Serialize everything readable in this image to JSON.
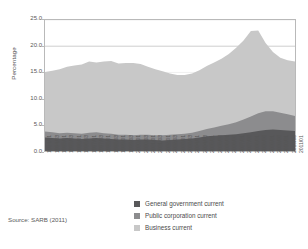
{
  "chart_data": {
    "type": "area",
    "stacked": true,
    "title": "",
    "subtitle": "",
    "xlabel": "",
    "ylabel": "Percentage",
    "ylim": [
      0.0,
      25.0
    ],
    "yticks": [
      "0.0",
      "5.0",
      "10.0",
      "15.0",
      "20.0",
      "25.0"
    ],
    "ytick_values": [
      0.0,
      5.0,
      10.0,
      15.0,
      20.0,
      25.0
    ],
    "grid": "horizontal",
    "legend_position": "bottom-right",
    "categories": [
      "1994/01",
      "1994/03",
      "1995/01",
      "1995/03",
      "1996/01",
      "1996/03",
      "1997/01",
      "1997/03",
      "1998/01",
      "1998/03",
      "1999/01",
      "1999/03",
      "2000/01",
      "2000/03",
      "2001/01",
      "2001/03",
      "2002/01",
      "2002/03",
      "2003/01",
      "2003/03",
      "2004/01",
      "2004/03",
      "2005/01",
      "2005/03",
      "2006/01",
      "2006/03",
      "2007/01",
      "2007/03",
      "2008/01",
      "2008/03",
      "2009/01",
      "2009/03",
      "2010/01",
      "2010/03",
      "2011/01"
    ],
    "tick_labels_shown": [
      "1994/01",
      "1994/03",
      "1995/01",
      "1995/03",
      "1996/01",
      "1996/03",
      "1997/01",
      "1997/03",
      "1998/01",
      "1998/03",
      "1999/01",
      "1999/03",
      "2000/01",
      "2000/03",
      "2001/01",
      "2001/03",
      "2002/01",
      "2002/03",
      "2003/01",
      "2003/03",
      "2004/01",
      "2004/03",
      "2005/01",
      "2005/03",
      "2006/01",
      "2006/03",
      "2007/01",
      "2007/03",
      "2008/01",
      "2008/03",
      "2009/01",
      "2009/03",
      "2010/01",
      "2010/03",
      "2011/01"
    ],
    "series": [
      {
        "name": "General government current",
        "color": "#58585a",
        "values": [
          2.6,
          2.5,
          2.4,
          2.5,
          2.4,
          2.3,
          2.4,
          2.5,
          2.4,
          2.3,
          2.2,
          2.2,
          2.1,
          2.2,
          2.2,
          2.1,
          2.0,
          2.1,
          2.2,
          2.3,
          2.4,
          2.6,
          2.8,
          2.9,
          3.0,
          3.1,
          3.2,
          3.4,
          3.6,
          3.8,
          4.0,
          4.1,
          4.0,
          3.9,
          3.8
        ]
      },
      {
        "name": "Public corporation current",
        "color": "#8c8c8e",
        "values": [
          1.1,
          1.1,
          1.0,
          1.0,
          1.0,
          1.0,
          1.1,
          1.1,
          1.0,
          1.0,
          0.9,
          0.9,
          0.9,
          0.9,
          0.9,
          0.9,
          1.0,
          1.0,
          1.0,
          1.0,
          1.1,
          1.2,
          1.4,
          1.6,
          1.8,
          2.0,
          2.3,
          2.6,
          3.0,
          3.4,
          3.6,
          3.5,
          3.3,
          3.1,
          2.9
        ]
      },
      {
        "name": "Business current",
        "color": "#c8c8c8",
        "values": [
          11.4,
          11.7,
          12.2,
          12.6,
          12.9,
          13.2,
          13.6,
          13.3,
          13.7,
          13.9,
          13.6,
          13.7,
          13.8,
          13.5,
          13.0,
          12.6,
          12.2,
          11.7,
          11.3,
          11.2,
          11.3,
          11.6,
          12.0,
          12.4,
          12.8,
          13.4,
          14.2,
          15.1,
          16.3,
          15.8,
          13.0,
          11.3,
          10.5,
          10.3,
          10.4
        ]
      }
    ],
    "totals": [
      15.1,
      15.3,
      15.6,
      16.1,
      16.3,
      16.5,
      17.1,
      16.9,
      17.1,
      17.2,
      16.7,
      16.8,
      16.8,
      16.6,
      16.1,
      15.6,
      15.2,
      14.8,
      14.5,
      14.5,
      14.8,
      15.4,
      16.2,
      16.9,
      17.6,
      18.5,
      19.7,
      21.1,
      22.9,
      23.0,
      20.6,
      18.9,
      17.8,
      17.3,
      17.1
    ],
    "annotations": []
  },
  "axis": {
    "y_title": "Percentage"
  },
  "legend": {
    "items": [
      {
        "label": "General government current",
        "color": "#58585a"
      },
      {
        "label": "Public corporation current",
        "color": "#8c8c8e"
      },
      {
        "label": "Business current",
        "color": "#c8c8c8"
      }
    ]
  },
  "footer": {
    "source": "Source: SARB (2011)"
  }
}
